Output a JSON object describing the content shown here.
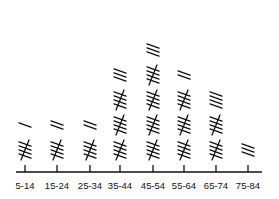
{
  "chart_data": {
    "type": "tally",
    "title": "",
    "xlabel": "",
    "ylabel": "",
    "categories": [
      "5-14",
      "15-24",
      "25-34",
      "35-44",
      "45-54",
      "55-64",
      "65-74",
      "75-84"
    ],
    "values": [
      6,
      7,
      7,
      18,
      23,
      17,
      14,
      3
    ],
    "tally_group_size": 5,
    "color": "#111111",
    "grid": false,
    "legend": null
  }
}
